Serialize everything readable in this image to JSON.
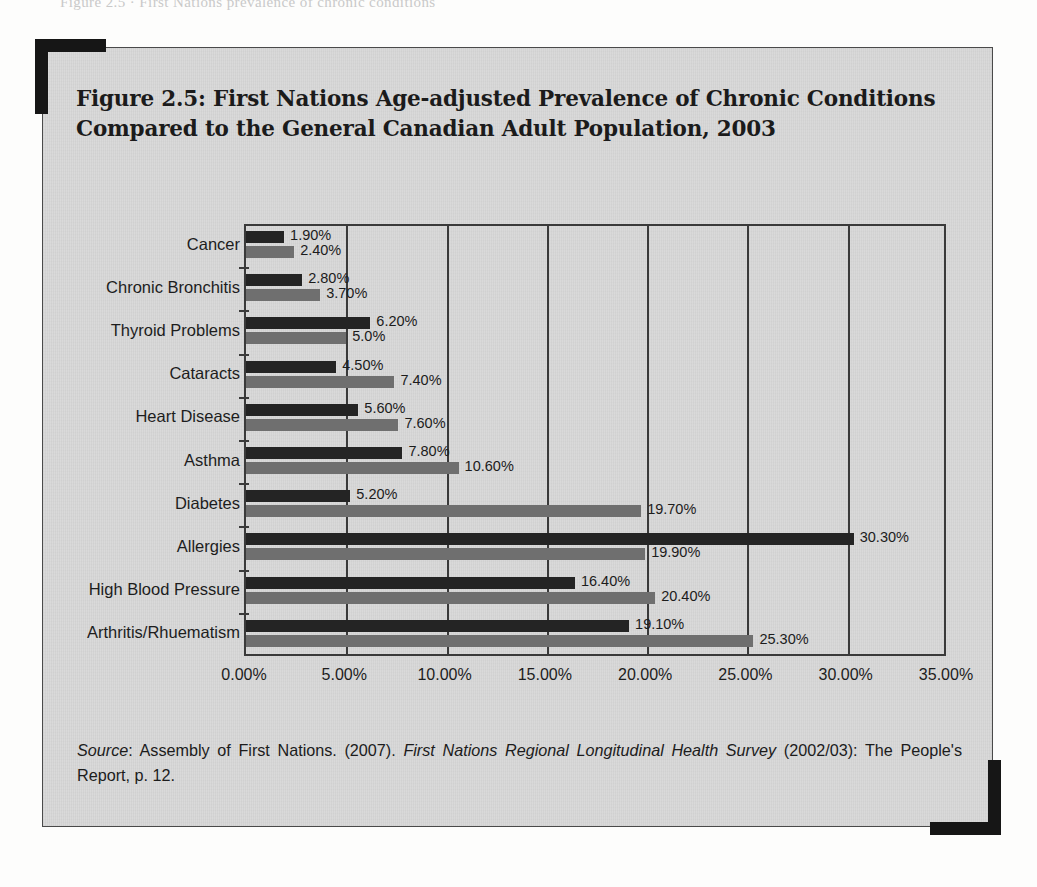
{
  "page_bleed_text": "Figure 2.5 ·  First Nations prevalence of chronic conditions",
  "figure": {
    "title": "Figure 2.5: First Nations Age-adjusted Prevalence of Chronic Conditions Compared to the General Canadian Adult Population, 2003",
    "source_label": "Source",
    "source_text_1": ": Assembly of First Nations. (2007). ",
    "source_italic": "First Nations Regional Longitudinal Health Survey",
    "source_text_2": " (2002/03): The People's Report, p. 12."
  },
  "colors": {
    "first_nations_bar": "#242424",
    "general_population_bar": "#6f6f6f",
    "paper": "#d9d9d9",
    "frame": "#3a3a3a",
    "bracket": "#161616"
  },
  "chart_data": {
    "type": "bar",
    "orientation": "horizontal",
    "title": "First Nations Age-adjusted Prevalence of Chronic Conditions Compared to the General Canadian Adult Population, 2003",
    "xlabel": "",
    "ylabel": "",
    "xlim": [
      0,
      35
    ],
    "xticks": [
      0,
      5,
      10,
      15,
      20,
      25,
      30,
      35
    ],
    "xtick_labels": [
      "0.00%",
      "5.00%",
      "10.00%",
      "15.00%",
      "20.00%",
      "25.00%",
      "30.00%",
      "35.00%"
    ],
    "grid": true,
    "legend": null,
    "categories": [
      "Cancer",
      "Chronic Bronchitis",
      "Thyroid Problems",
      "Cataracts",
      "Heart Disease",
      "Asthma",
      "Diabetes",
      "Allergies",
      "High Blood Pressure",
      "Arthritis/Rhuematism"
    ],
    "series": [
      {
        "name": "First Nations",
        "color": "#242424",
        "values": [
          1.9,
          2.8,
          6.2,
          4.5,
          5.6,
          7.8,
          5.2,
          30.3,
          16.4,
          19.1
        ],
        "labels": [
          "1.90%",
          "2.80%",
          "6.20%",
          "4.50%",
          "5.60%",
          "7.80%",
          "5.20%",
          "30.30%",
          "16.40%",
          "19.10%"
        ]
      },
      {
        "name": "General Canadian Adult Population",
        "color": "#6f6f6f",
        "values": [
          2.4,
          3.7,
          5.0,
          7.4,
          7.6,
          10.6,
          19.7,
          19.9,
          20.4,
          25.3
        ],
        "labels": [
          "2.40%",
          "3.70%",
          "5.0%",
          "7.40%",
          "7.60%",
          "10.60%",
          "19.70%",
          "19.90%",
          "20.40%",
          "25.30%"
        ]
      }
    ]
  }
}
